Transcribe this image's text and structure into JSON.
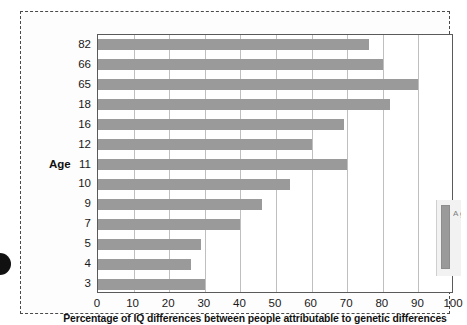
{
  "figure": {
    "y_axis_title": "Age",
    "x_axis_title": "Percentage of IQ differences between people attributable to genetic differences",
    "bar_color": "#9a9a9a",
    "gridline_color": "#bfbfbf",
    "axis_color": "#5a5a5a",
    "frame_style": "dashed"
  },
  "side_legend": {
    "swatch_color": "#9a9a9a",
    "text": "A g 9"
  },
  "chart_data": {
    "type": "bar",
    "orientation": "horizontal",
    "title": "",
    "subtitle": "",
    "xlabel": "Percentage of IQ differences between people attributable to genetic differences",
    "ylabel": "Age",
    "categories": [
      "82",
      "66",
      "65",
      "18",
      "16",
      "12",
      "11",
      "10",
      "9",
      "7",
      "5",
      "4",
      "3"
    ],
    "values": [
      76,
      80,
      90,
      82,
      69,
      60,
      70,
      54,
      46,
      40,
      29,
      26,
      30
    ],
    "xlim": [
      0,
      100
    ],
    "xticks": [
      0,
      10,
      20,
      30,
      40,
      50,
      60,
      70,
      80,
      90,
      100
    ],
    "grid": true,
    "legend": false,
    "series": [
      {
        "name": "Percentage of IQ differences attributable to genetic differences",
        "values": [
          76,
          80,
          90,
          82,
          69,
          60,
          70,
          54,
          46,
          40,
          29,
          26,
          30
        ]
      }
    ]
  }
}
